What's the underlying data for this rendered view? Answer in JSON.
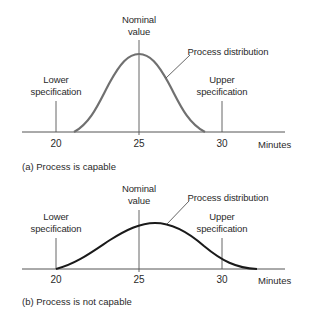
{
  "panels": [
    {
      "id": "a",
      "caption": "(a) Process is capable",
      "nominal_label": [
        "Nominal",
        "value"
      ],
      "distribution_label": "Process distribution",
      "lower_spec_label": [
        "Lower",
        "specification"
      ],
      "upper_spec_label": [
        "Upper",
        "specification"
      ],
      "ticks": [
        "20",
        "25",
        "30"
      ],
      "unit": "Minutes",
      "curve_color": "#707070",
      "lower_spec": 20,
      "upper_spec": 30,
      "nominal": 25,
      "distribution_mean": 25,
      "distribution_range": [
        21,
        29
      ]
    },
    {
      "id": "b",
      "caption": "(b) Process is not capable",
      "nominal_label": [
        "Nominal",
        "value"
      ],
      "distribution_label": "Process distribution",
      "lower_spec_label": [
        "Lower",
        "specification"
      ],
      "upper_spec_label": [
        "Upper",
        "specification"
      ],
      "ticks": [
        "20",
        "25",
        "30"
      ],
      "unit": "Minutes",
      "curve_color": "#1a1a1a",
      "lower_spec": 20,
      "upper_spec": 30,
      "nominal": 25,
      "distribution_mean": 26,
      "distribution_range": [
        20,
        32
      ]
    }
  ]
}
